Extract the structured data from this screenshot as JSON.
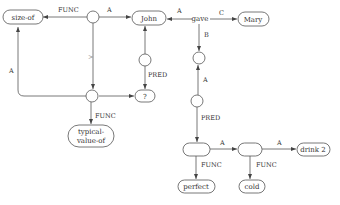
{
  "diagram": {
    "type": "semantic-network",
    "nodes": {
      "size_of": "size-of",
      "john": "John",
      "gave": "gave",
      "mary": "Mary",
      "question": "?",
      "typical_value_of_line1": "typical-",
      "typical_value_of_line2": "value-of",
      "perfect": "perfect",
      "cold": "cold",
      "drink2": "drink 2"
    },
    "edge_labels": {
      "func_top": "FUNC",
      "a_top": "A",
      "a_gave_john": "A",
      "c_gave_mary": "C",
      "b_gave_down": "B",
      "greater_than": ">",
      "a_left": "A",
      "pred_john": "PRED",
      "func_typical": "FUNC",
      "a_right_up": "A",
      "pred_right": "PRED",
      "a_bottom1": "A",
      "a_bottom2": "A",
      "func_perfect": "FUNC",
      "func_cold": "FUNC"
    },
    "colors": {
      "stroke": "#555555",
      "text": "#333333",
      "background": "#ffffff"
    }
  }
}
